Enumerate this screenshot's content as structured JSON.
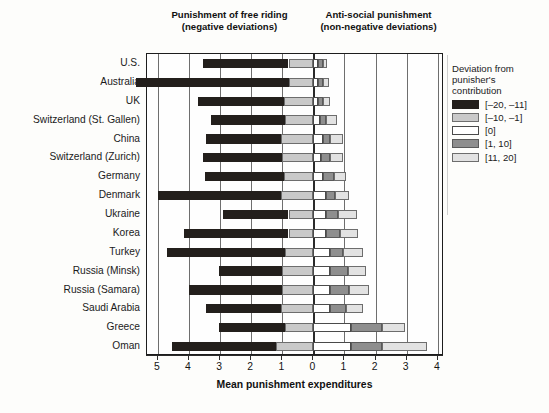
{
  "headers": {
    "left_line1": "Punishment of free riding",
    "left_line2": "(negative deviations)",
    "right_line1": "Anti-social punishment",
    "right_line2": "(non-negative deviations)"
  },
  "legend": {
    "title_line1": "Deviation from",
    "title_line2": "punisher's",
    "title_line3": "contribution",
    "entries": [
      {
        "label": "[–20, –11]",
        "color": "#231f1c",
        "border": "#231f1c"
      },
      {
        "label": "[–10, –1]",
        "color": "#c9c9c9",
        "border": "#6d6d6d"
      },
      {
        "label": "[0]",
        "color": "#ffffff",
        "border": "#4a4a4a"
      },
      {
        "label": "[1, 10]",
        "color": "#8e8e8e",
        "border": "#5a5a5a"
      },
      {
        "label": "[11, 20]",
        "color": "#e2e2e2",
        "border": "#6d6d6d"
      }
    ]
  },
  "chart_data": {
    "type": "bar",
    "orientation": "horizontal",
    "stacked": true,
    "title": "",
    "xlabel": "Mean punishment expenditures",
    "ylabel": "",
    "grid": true,
    "legend_position": "right",
    "xlim": [
      -5.35,
      4.2
    ],
    "xticks": [
      -5,
      -4,
      -3,
      -2,
      -1,
      0,
      1,
      2,
      3,
      4
    ],
    "xticklabels": [
      "5",
      "4",
      "3",
      "2",
      "1",
      "0",
      "1",
      "2",
      "3",
      "4"
    ],
    "categories": [
      "U.S.",
      "Australia",
      "UK",
      "Switzerland (St. Gallen)",
      "China",
      "Switzerland (Zurich)",
      "Germany",
      "Denmark",
      "Ukraine",
      "Korea",
      "Turkey",
      "Russia (Minsk)",
      "Russia (Samara)",
      "Saudi Arabia",
      "Greece",
      "Oman"
    ],
    "series": [
      {
        "name": "[–20, –11]",
        "values": [
          2.75,
          4.9,
          2.75,
          2.4,
          2.4,
          2.55,
          2.55,
          3.95,
          2.1,
          3.35,
          3.8,
          2.05,
          3.0,
          2.4,
          2.15,
          3.35
        ]
      },
      {
        "name": "[–10, –1]",
        "values": [
          0.8,
          0.8,
          0.95,
          0.9,
          1.05,
          1.0,
          0.95,
          1.05,
          0.8,
          0.8,
          0.9,
          1.0,
          1.0,
          1.05,
          0.9,
          1.2
        ]
      },
      {
        "name": "[0]",
        "values": [
          0.15,
          0.15,
          0.15,
          0.2,
          0.3,
          0.25,
          0.3,
          0.4,
          0.4,
          0.4,
          0.55,
          0.55,
          0.55,
          0.55,
          1.2,
          1.2
        ]
      },
      {
        "name": "[1, 10]",
        "values": [
          0.15,
          0.15,
          0.15,
          0.2,
          0.25,
          0.3,
          0.35,
          0.3,
          0.4,
          0.45,
          0.4,
          0.55,
          0.6,
          0.5,
          1.0,
          1.0
        ]
      },
      {
        "name": "[11, 20]",
        "values": [
          0.15,
          0.2,
          0.25,
          0.35,
          0.4,
          0.4,
          0.4,
          0.45,
          0.6,
          0.6,
          0.65,
          0.6,
          0.65,
          0.55,
          0.75,
          1.45
        ]
      }
    ]
  }
}
